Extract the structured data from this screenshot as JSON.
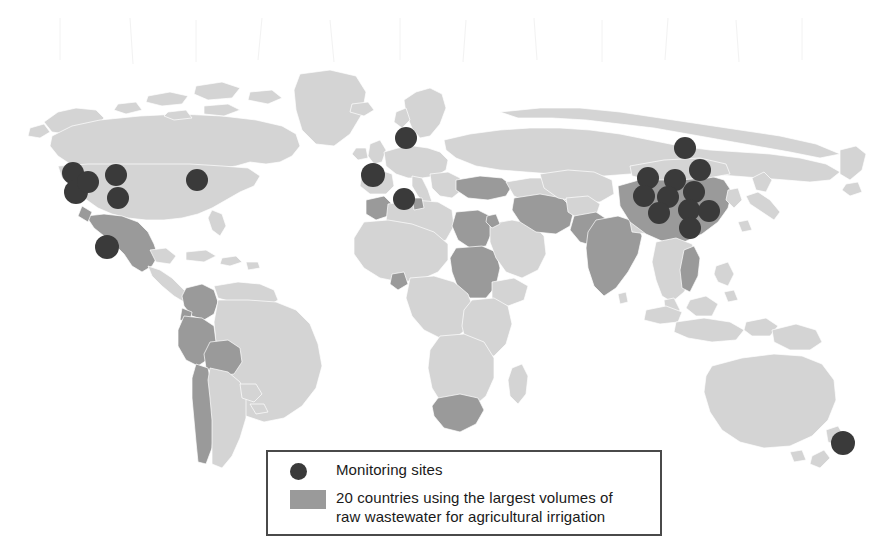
{
  "figure": {
    "type": "world-map",
    "width": 874,
    "height": 554,
    "background_color": "#ffffff",
    "projection": "equirectangular"
  },
  "colors": {
    "land_default": "#d4d4d4",
    "land_highlight": "#9a9a9a",
    "ocean": "#ffffff",
    "country_border": "#ffffff",
    "monitoring_dot": "#3a3a3a",
    "legend_border": "#4a4a4a",
    "legend_text": "#1a1a1a",
    "graticule": "#f0f0f0"
  },
  "legend": {
    "items": [
      {
        "key": "dot",
        "label": "Monitoring sites",
        "color": "#3a3a3a"
      },
      {
        "key": "swatch",
        "label": "20 countries using the largest volumes of\nraw wastewater for agricultural irrigation",
        "color": "#9a9a9a"
      }
    ],
    "sites_label": "Monitoring sites",
    "countries_label": "20 countries using the largest volumes of\nraw wastewater for agricultural irrigation"
  },
  "chart_data": {
    "type": "map",
    "title": "",
    "legend_position": "bottom-center",
    "highlight_count": 20,
    "highlighted_countries": [
      "Mexico",
      "Colombia",
      "Peru",
      "Bolivia",
      "Chile",
      "Morocco",
      "Egypt",
      "Sudan",
      "South Africa",
      "Turkey",
      "Iran",
      "Pakistan",
      "India",
      "China",
      "Vietnam",
      "Ghana",
      "Jordan",
      "Israel",
      "Tunisia",
      "Spain"
    ],
    "monitoring_sites": [
      {
        "region": "North America",
        "x": 73,
        "y": 173,
        "r": 11
      },
      {
        "region": "North America",
        "x": 76,
        "y": 192,
        "r": 12
      },
      {
        "region": "North America",
        "x": 88,
        "y": 182,
        "r": 11
      },
      {
        "region": "North America",
        "x": 116,
        "y": 175,
        "r": 11
      },
      {
        "region": "North America",
        "x": 118,
        "y": 198,
        "r": 11
      },
      {
        "region": "North America",
        "x": 197,
        "y": 180,
        "r": 11
      },
      {
        "region": "North America",
        "x": 107,
        "y": 247,
        "r": 12
      },
      {
        "region": "Europe",
        "x": 406,
        "y": 138,
        "r": 11
      },
      {
        "region": "Europe",
        "x": 373,
        "y": 175,
        "r": 12
      },
      {
        "region": "Europe",
        "x": 404,
        "y": 199,
        "r": 11
      },
      {
        "region": "East Asia",
        "x": 685,
        "y": 148,
        "r": 11
      },
      {
        "region": "East Asia",
        "x": 700,
        "y": 170,
        "r": 11
      },
      {
        "region": "East Asia",
        "x": 648,
        "y": 178,
        "r": 11
      },
      {
        "region": "East Asia",
        "x": 675,
        "y": 180,
        "r": 11
      },
      {
        "region": "East Asia",
        "x": 694,
        "y": 192,
        "r": 11
      },
      {
        "region": "East Asia",
        "x": 644,
        "y": 196,
        "r": 11
      },
      {
        "region": "East Asia",
        "x": 668,
        "y": 197,
        "r": 11
      },
      {
        "region": "East Asia",
        "x": 659,
        "y": 213,
        "r": 11
      },
      {
        "region": "East Asia",
        "x": 689,
        "y": 210,
        "r": 11
      },
      {
        "region": "East Asia",
        "x": 709,
        "y": 211,
        "r": 11
      },
      {
        "region": "East Asia",
        "x": 690,
        "y": 228,
        "r": 11
      },
      {
        "region": "Oceania",
        "x": 843,
        "y": 443,
        "r": 12
      }
    ],
    "site_count": 22
  }
}
